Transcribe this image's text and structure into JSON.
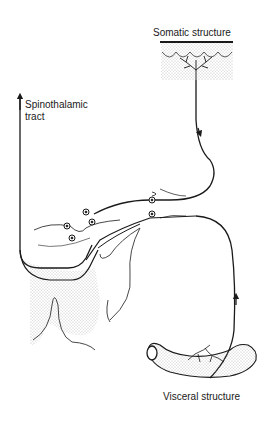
{
  "diagram": {
    "type": "neuroanatomy schematic",
    "labels": {
      "somatic": "Somatic structure",
      "spinothalamic_line1": "Spinothalamic",
      "spinothalamic_line2": "tract",
      "visceral": "Visceral structure"
    },
    "colors": {
      "ink": "#1a1a1a",
      "stipple": "#8a8a8a",
      "background": "#ffffff"
    }
  }
}
